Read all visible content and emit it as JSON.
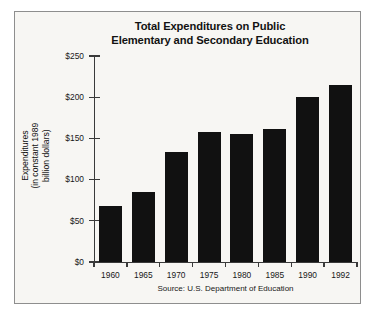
{
  "chart_data": {
    "type": "bar",
    "title": "Total Expenditures on Public Elementary and Secondary Education",
    "title_lines": [
      "Total Expenditures on Public",
      "Elementary and Secondary Education"
    ],
    "categories": [
      "1960",
      "1965",
      "1970",
      "1975",
      "1980",
      "1985",
      "1990",
      "1992"
    ],
    "values": [
      68,
      85,
      134,
      158,
      155,
      162,
      200,
      215
    ],
    "xlabel": "",
    "ylabel": "Expenditures (in constant 1989 billion dollars)",
    "ylabel_lines": [
      "Expenditures",
      "(in constant 1989",
      "billion dollars)"
    ],
    "ylim": [
      0,
      250
    ],
    "ytick_values": [
      0,
      50,
      100,
      150,
      200,
      250
    ],
    "ytick_labels": [
      "$0",
      "$50",
      "$100",
      "$150",
      "$200",
      "$250"
    ],
    "grid": false,
    "legend": "none",
    "bar_color": "#111111",
    "background_color": "#f7f6f3",
    "source": "Source: U.S. Department of Education"
  }
}
